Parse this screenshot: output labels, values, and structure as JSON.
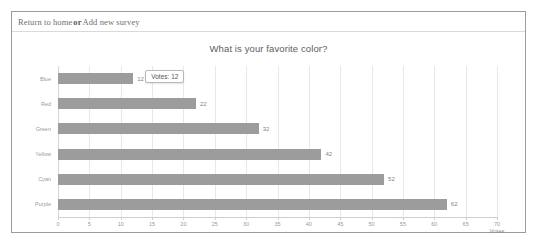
{
  "window": {
    "background": "#ffffff",
    "card_border": "#9b9b9b"
  },
  "navbar": {
    "return_label": "Return to home",
    "separator": "or",
    "add_label": "Add new survey"
  },
  "chart_data": {
    "type": "bar",
    "orientation": "horizontal",
    "title": "What is your favorite color?",
    "xlabel": "Votes",
    "ylabel": "",
    "categories": [
      "Blue",
      "Red",
      "Green",
      "Yellow",
      "Cyan",
      "Purple"
    ],
    "values": [
      12,
      22,
      32,
      42,
      52,
      62
    ],
    "value_labels": [
      "12",
      "22",
      "32",
      "42",
      "52",
      "62"
    ],
    "xlim": [
      0,
      70
    ],
    "xticks": [
      0,
      5,
      10,
      15,
      20,
      25,
      30,
      35,
      40,
      45,
      50,
      55,
      60,
      65,
      70
    ],
    "xtick_labels": [
      "0",
      "5",
      "10",
      "15",
      "20",
      "25",
      "30",
      "35",
      "40",
      "45",
      "50",
      "55",
      "60",
      "65",
      "70"
    ],
    "grid": true,
    "legend": false,
    "bar_color": "#9c9c9c",
    "grid_color": "#e8e8e8"
  },
  "tooltip": {
    "visible": true,
    "series_label": "Votes:",
    "value": "12",
    "target_category": "Blue"
  }
}
